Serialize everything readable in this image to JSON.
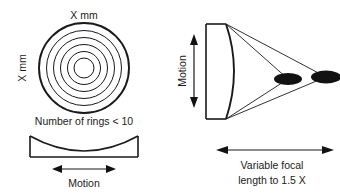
{
  "figure": {
    "title_hidden": "",
    "background_color": "#ffffff",
    "line_color": "#1a1a1a",
    "blob_color": "#121212"
  },
  "left_diagram": {
    "name": "concentric-rings-lens-front-view",
    "top_label": "X mm",
    "side_label": "X mm",
    "caption": "Number of rings < 10",
    "ring_count": 6,
    "ring_radii": [
      45,
      37,
      30,
      23,
      16,
      10
    ],
    "motion_label": "Motion",
    "motion_arrow": "double-horizontal"
  },
  "right_diagram": {
    "name": "focal-length-side-view",
    "motion_label": "Motion",
    "motion_arrow": "double-vertical",
    "caption_line1": "Variable focal",
    "caption_line2": "length to 1.5 X",
    "focal_arrow": "double-horizontal",
    "focus_spots": [
      {
        "name": "near-focus-spot",
        "cx": 288,
        "cy": 79,
        "rx": 14,
        "ry": 6
      },
      {
        "name": "far-focus-spot",
        "cx": 326,
        "cy": 77,
        "rx": 15,
        "ry": 6.5
      }
    ]
  }
}
